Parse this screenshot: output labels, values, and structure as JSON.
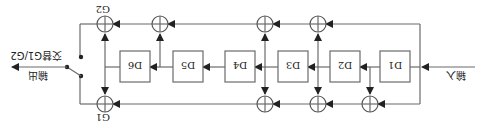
{
  "diagram": {
    "title": "",
    "orientation": "rotated-180",
    "labels": {
      "input": "输入",
      "output": "输出",
      "switch_note": "交替G1/G2",
      "g1": "G1",
      "g2": "G2"
    },
    "registers": [
      {
        "id": "D1",
        "label": "D1"
      },
      {
        "id": "D2",
        "label": "D2"
      },
      {
        "id": "D3",
        "label": "D3"
      },
      {
        "id": "D4",
        "label": "D4"
      },
      {
        "id": "D5",
        "label": "D5"
      },
      {
        "id": "D6",
        "label": "D6"
      }
    ],
    "colors": {
      "line": "#6b6b6b",
      "text": "#222222",
      "background": "#ffffff"
    }
  }
}
